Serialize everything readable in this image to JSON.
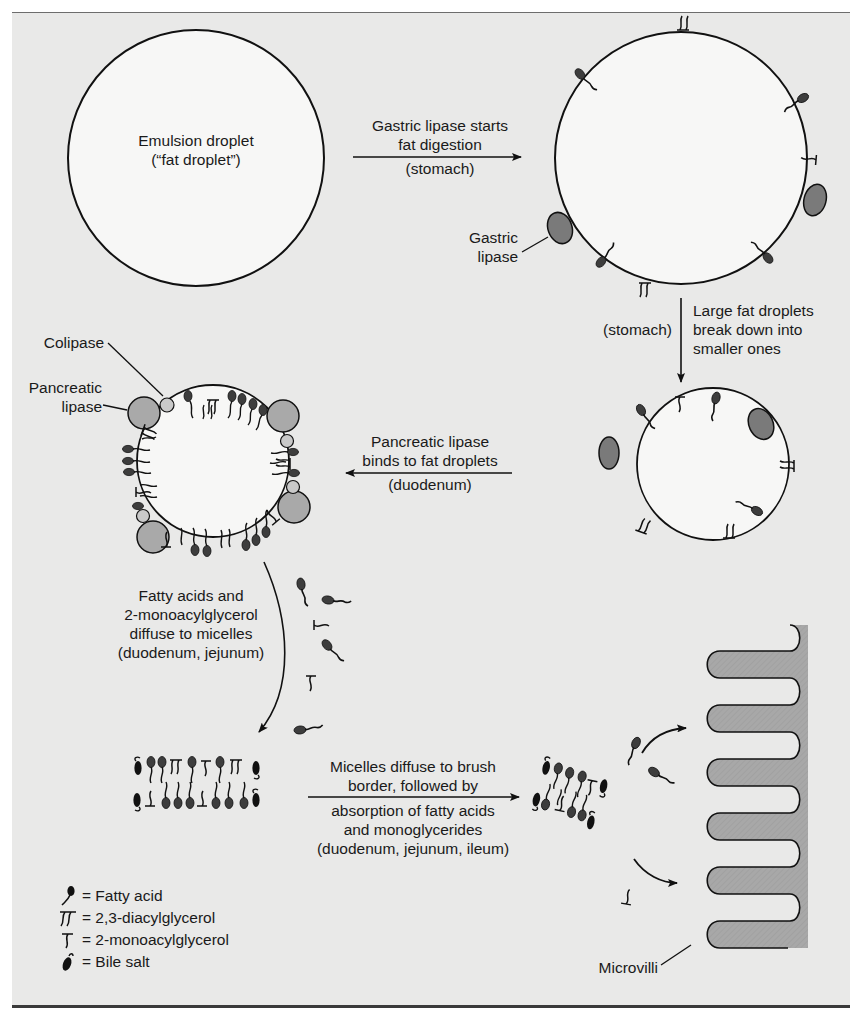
{
  "diagram": {
    "colors": {
      "background": "#e9e9e8",
      "droplet_fill": "#f6f6f5",
      "gastric_lipase": "#7a7a7a",
      "pancreatic_lipase": "#a9a9a9",
      "colipase": "#c9c9c9",
      "fatty_acid_head": "#3d3d3d",
      "microvilli_fill": "#a8a8a8",
      "line": "#111111"
    },
    "nodes": {
      "emulsion_droplet": {
        "line1": "Emulsion droplet",
        "line2": "(“fat droplet”)"
      },
      "gastric_lipase_label": {
        "line1": "Gastric",
        "line2": "lipase"
      },
      "colipase_label": "Colipase",
      "pancreatic_lipase_label": {
        "line1": "Pancreatic",
        "line2": "lipase"
      },
      "microvilli_label": "Microvilli"
    },
    "steps": [
      {
        "id": "step1",
        "above_line1": "Gastric lipase starts",
        "above_line2": "fat digestion",
        "below": "(stomach)",
        "direction": "right"
      },
      {
        "id": "step2",
        "side_left": "(stomach)",
        "line1": "Large fat droplets",
        "line2": "break down into",
        "line3": "smaller ones",
        "direction": "down"
      },
      {
        "id": "step3",
        "above_line1": "Pancreatic lipase",
        "above_line2": "binds to fat droplets",
        "below": "(duodenum)",
        "direction": "left"
      },
      {
        "id": "step4",
        "line1": "Fatty acids and",
        "line2": "2-monoacylglycerol",
        "line3": "diffuse to micelles",
        "line4": "(duodenum, jejunum)",
        "direction": "down-curve"
      },
      {
        "id": "step5",
        "above_line1": "Micelles diffuse to brush",
        "above_line2": "border, followed by",
        "below_line1": "absorption of fatty acids",
        "below_line2": "and monoglycerides",
        "below_line3": "(duodenum, jejunum, ileum)",
        "direction": "right"
      }
    ],
    "legend": [
      {
        "icon": "fatty-acid-icon",
        "label": "= Fatty acid"
      },
      {
        "icon": "diacylglycerol-icon",
        "label": "= 2,3-diacylglycerol"
      },
      {
        "icon": "monoacylglycerol-icon",
        "label": "= 2-monoacylglycerol"
      },
      {
        "icon": "bile-salt-icon",
        "label": "= Bile salt"
      }
    ]
  }
}
